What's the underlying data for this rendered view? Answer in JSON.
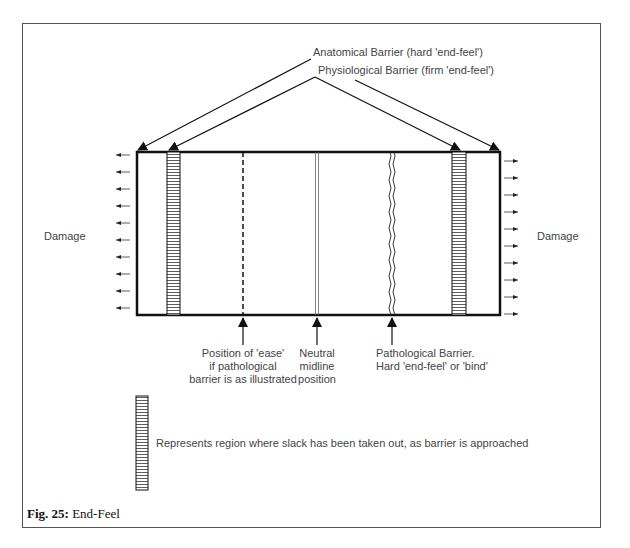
{
  "figure": {
    "caption_number": "Fig. 25:",
    "caption_title": "End-Feel"
  },
  "labels": {
    "anatomical": "Anatomical Barrier (hard 'end-feel')",
    "physiological": "Physiological Barrier (firm 'end-feel')",
    "damage_left": "Damage",
    "damage_right": "Damage",
    "ease": [
      "Position of 'ease'",
      "if pathological",
      "barrier is as illustrated"
    ],
    "neutral": [
      "Neutral",
      "midline",
      "position"
    ],
    "pathological": [
      "Pathological Barrier.",
      "Hard 'end-feel' or 'bind'"
    ],
    "legend": "Represents region where slack has been taken out, as barrier is approached"
  },
  "colors": {
    "line": "#111111",
    "text": "#444444",
    "frame": "#555555"
  }
}
